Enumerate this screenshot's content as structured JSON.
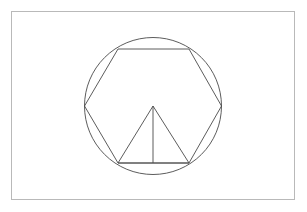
{
  "document": {
    "title": "Geometric Construction Figure",
    "background_color": "#ffffff",
    "width": 307,
    "height": 212
  },
  "frame": {
    "name": "outer-border-frame",
    "x": 11.5,
    "y": 11.5,
    "width": 283,
    "height": 188,
    "stroke_color": "#b9b9b9",
    "stroke_width": 1,
    "fill_color": "#ffffff"
  },
  "figure": {
    "stroke_color": "#4a4a4a",
    "stroke_width": 0.9,
    "center": {
      "x": 153,
      "y": 106
    }
  },
  "chart_data": {
    "type": "diagram",
    "shapes": [
      {
        "name": "circumscribed-circle",
        "kind": "circle",
        "cx": 153,
        "cy": 106,
        "r": 68.5
      },
      {
        "name": "inscribed-hexagon",
        "kind": "polygon",
        "vertices": [
          {
            "label": "left",
            "x": 84.5,
            "y": 106
          },
          {
            "label": "top-left",
            "x": 118,
            "y": 49
          },
          {
            "label": "top-right",
            "x": 189,
            "y": 49
          },
          {
            "label": "right",
            "x": 221.5,
            "y": 106
          },
          {
            "label": "bottom-right",
            "x": 189,
            "y": 163
          },
          {
            "label": "bottom-left",
            "x": 118,
            "y": 163
          }
        ],
        "points_string": "84.5,106 118,49 189,49 221.5,106 189,163 118,163"
      },
      {
        "name": "inner-triangle",
        "kind": "polygon",
        "vertices": [
          {
            "label": "apex",
            "x": 153,
            "y": 106
          },
          {
            "label": "base-right",
            "x": 189,
            "y": 163
          },
          {
            "label": "base-left",
            "x": 118,
            "y": 163
          }
        ],
        "points_string": "153,106 189,163 118,163"
      },
      {
        "name": "triangle-median-line",
        "kind": "line",
        "x1": 153,
        "y1": 106,
        "x2": 153,
        "y2": 163
      }
    ]
  }
}
